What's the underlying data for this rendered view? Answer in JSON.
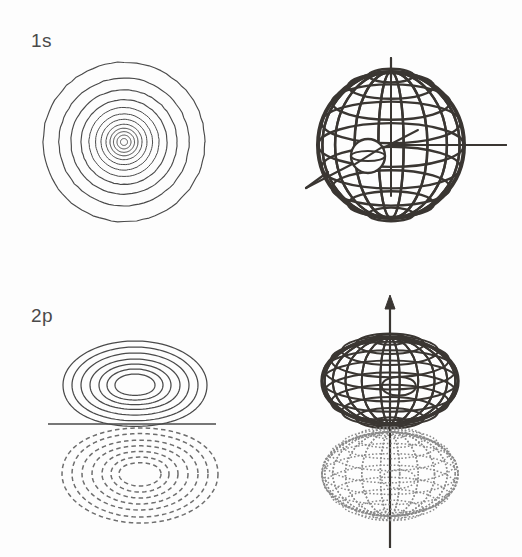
{
  "figure": {
    "background_color": "#fdfdfd",
    "ink_color": "#3a3632",
    "contour_color": "#4a4a4a",
    "dashed_color": "#6e6e6e",
    "dotted_color": "#8a8a8a",
    "width": 522,
    "height": 557
  },
  "labels": {
    "row1": "1s",
    "row2": "2p"
  },
  "panels": [
    {
      "id": "1s-contour",
      "name": "1s-contour-plot",
      "type": "contour",
      "orbital": "1s",
      "style": "concentric-circles",
      "line_style": "solid",
      "center": [
        124,
        142
      ],
      "outer_radius": 81,
      "ring_count": 12,
      "ring_radii": [
        81,
        65,
        53,
        43,
        35,
        28.5,
        23,
        18,
        14,
        10.5,
        7,
        3.5
      ],
      "sign": "positive",
      "nodes": 0
    },
    {
      "id": "1s-3d",
      "name": "1s-3d-wireframe-sphere",
      "type": "wireframe-3d",
      "orbital": "1s",
      "shape": "sphere",
      "center": [
        391,
        145
      ],
      "radius": 73,
      "latitude_lines": 9,
      "longitude_lines": 9,
      "inner_sphere": {
        "center": [
          368,
          156
        ],
        "radius": 17
      },
      "axes": [
        {
          "name": "z-axis",
          "type": "vertical",
          "from": [
            391,
            58
          ],
          "to": [
            391,
            196
          ],
          "arrow": false
        },
        {
          "name": "y-axis",
          "type": "horizontal",
          "from": [
            391,
            145
          ],
          "to": [
            506,
            145
          ],
          "arrow": false
        },
        {
          "name": "x-axis",
          "type": "diagonal",
          "from": [
            418,
            130
          ],
          "to": [
            306,
            188
          ],
          "arrow": false
        }
      ]
    },
    {
      "id": "2p-contour",
      "name": "2p-contour-plot",
      "type": "contour",
      "orbital": "2p",
      "style": "two-lobes",
      "nodal_line": {
        "from": [
          48,
          424
        ],
        "to": [
          216,
          424
        ]
      },
      "upper_lobe": {
        "sign": "positive",
        "line_style": "solid",
        "center": [
          135,
          385
        ],
        "contour_count": 7,
        "radii_x": [
          72,
          63,
          54,
          45,
          36,
          28,
          20
        ],
        "radii_y": [
          44,
          38,
          32,
          26,
          21,
          16,
          11
        ]
      },
      "lower_lobe": {
        "sign": "negative",
        "line_style": "dashed",
        "center": [
          140,
          474
        ],
        "contour_count": 7,
        "radii_x": [
          78,
          68,
          58,
          48,
          38,
          29,
          21
        ],
        "radii_y": [
          49,
          43,
          36,
          30,
          24,
          18,
          12
        ]
      },
      "nodes": 1
    },
    {
      "id": "2p-3d",
      "name": "2p-3d-wireframe-lobes",
      "type": "wireframe-3d",
      "orbital": "2p",
      "shape": "two-oblate-lobes",
      "upper_lobe": {
        "sign": "positive",
        "line_style": "solid",
        "center": [
          390,
          381
        ],
        "radius_x": 68,
        "radius_y": 43,
        "mesh_u": 11,
        "mesh_v": 6
      },
      "lower_lobe": {
        "sign": "negative",
        "line_style": "dotted",
        "center": [
          390,
          474
        ],
        "radius_x": 68,
        "radius_y": 42,
        "mesh_u": 11,
        "mesh_v": 6
      },
      "axes": [
        {
          "name": "z-axis",
          "type": "vertical",
          "from": [
            390,
            296
          ],
          "to": [
            390,
            548
          ],
          "arrow": true,
          "arrow_at": "top"
        }
      ]
    }
  ]
}
